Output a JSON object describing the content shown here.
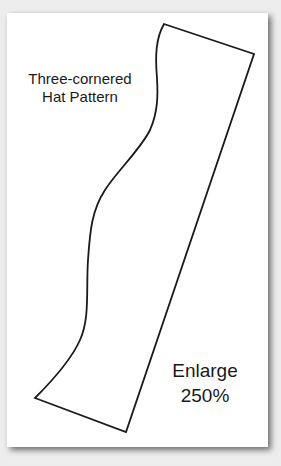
{
  "pattern": {
    "title_line1": "Three-cornered",
    "title_line2": "Hat Pattern",
    "note_line1": "Enlarge",
    "note_line2": "250%"
  },
  "colors": {
    "background": "#ededed",
    "paper": "#ffffff",
    "line": "#1a1a1a"
  }
}
